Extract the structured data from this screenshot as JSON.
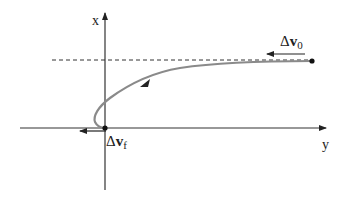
{
  "diagram": {
    "axes": {
      "vertical_label": "x",
      "horizontal_label": "y"
    },
    "vectors": {
      "initial": {
        "symbol": "Δ",
        "bold": "v",
        "subscript": "0"
      },
      "final": {
        "symbol": "Δ",
        "bold": "v",
        "subscript": "f"
      }
    },
    "colors": {
      "axis": "#333333",
      "trajectory": "#8a8a8a",
      "dashed_line": "#333333",
      "arrow": "#222222"
    }
  }
}
